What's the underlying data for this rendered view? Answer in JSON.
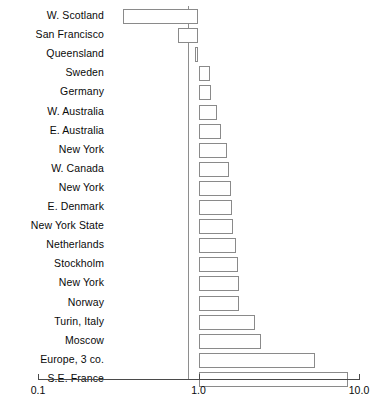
{
  "chart_data": {
    "type": "bar",
    "orientation": "horizontal",
    "title": "",
    "subtitle": "",
    "xlabel": "",
    "ylabel": "",
    "scale": "log",
    "xlim": [
      0.1,
      10.0
    ],
    "grid": false,
    "legend": null,
    "reference_line": 1.0,
    "axis_ticks": [
      {
        "value": 0.1,
        "label": "0.1"
      },
      {
        "value": 1.0,
        "label": "1.0"
      },
      {
        "value": 10.0,
        "label": "10.0"
      }
    ],
    "categories": [
      "W. Scotland",
      "San Francisco",
      "Queensland",
      "Sweden",
      "Germany",
      "W. Australia",
      "E. Australia",
      "New York",
      "W. Canada",
      "New York",
      "E. Denmark",
      "New York State",
      "Netherlands",
      "Stockholm",
      "New York",
      "Norway",
      "Turin, Italy",
      "Moscow",
      "Europe, 3 co.",
      "S.E. France"
    ],
    "values": [
      0.34,
      0.75,
      0.95,
      1.18,
      1.2,
      1.3,
      1.38,
      1.5,
      1.55,
      1.6,
      1.62,
      1.65,
      1.72,
      1.75,
      1.78,
      1.8,
      2.25,
      2.45,
      5.3,
      8.6
    ],
    "bar_style": {
      "fill": "#ffffff",
      "stroke": "#8a8a8a",
      "stroke_width": 1
    }
  },
  "colors": {
    "background": "#ffffff",
    "text": "#0a0a0a",
    "axis": "#4a4a4a",
    "bar_outline": "#8a8a8a"
  }
}
